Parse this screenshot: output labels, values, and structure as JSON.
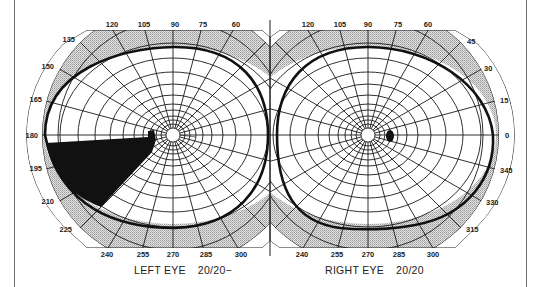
{
  "figure": {
    "type": "visual-field-perimetry-chart",
    "left_eye": {
      "label": "LEFT EYE",
      "acuity": "20/20−",
      "top_ticks": [
        "120",
        "105",
        "90",
        "75",
        "60"
      ],
      "left_ticks": [
        "135",
        "150",
        "165",
        "180",
        "195",
        "210",
        "225"
      ],
      "bottom_ticks": [
        "240",
        "255",
        "270",
        "285",
        "300"
      ],
      "defect": "dense scotoma inferior-temporal sector (~180° to ~225°) extending to blind spot"
    },
    "right_eye": {
      "label": "RIGHT EYE",
      "acuity": "20/20",
      "top_ticks": [
        "120",
        "105",
        "90",
        "75",
        "60"
      ],
      "right_ticks": [
        "45",
        "30",
        "15",
        "0",
        "345",
        "330",
        "315"
      ],
      "bottom_ticks": [
        "240",
        "255",
        "270",
        "285",
        "300"
      ],
      "defect": "normal blind spot only"
    },
    "colors": {
      "grid": "#1a1a1a",
      "shaded_band": "#c8c8c8",
      "scotoma": "#111111",
      "background": "#ffffff"
    }
  }
}
